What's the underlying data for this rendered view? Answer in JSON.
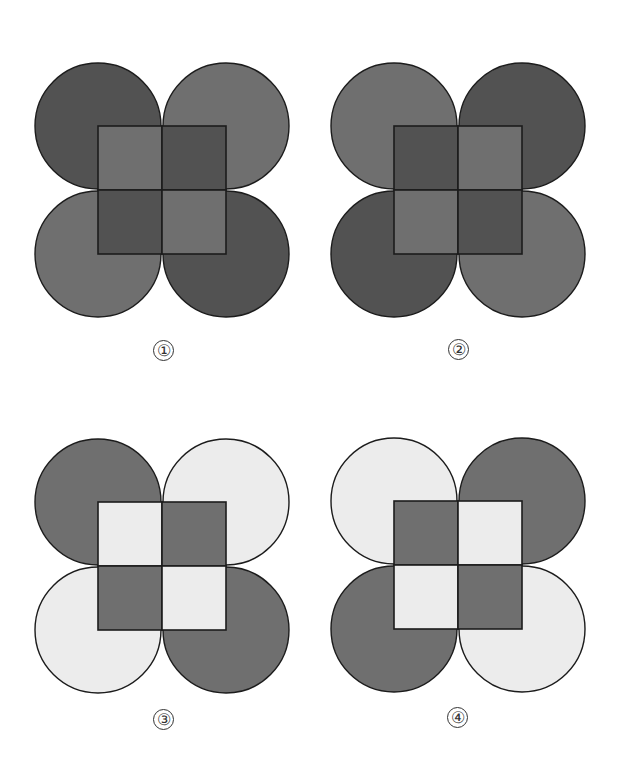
{
  "colors": {
    "dark": "#525252",
    "medium": "#6f6f6f",
    "light": "#ececec",
    "stroke": "#1c1c1c",
    "background": "#ffffff"
  },
  "geometry": {
    "radius": 63,
    "square_half_side": 64
  },
  "figures": [
    {
      "label": "①",
      "center": [
        162,
        190
      ],
      "label_pos": [
        153,
        340
      ],
      "circles": {
        "top_left": "dark",
        "top_right": "medium",
        "bottom_left": "medium",
        "bottom_right": "dark"
      },
      "quadrants": {
        "top_left": "medium",
        "top_right": "dark",
        "bottom_left": "dark",
        "bottom_right": "medium"
      }
    },
    {
      "label": "②",
      "center": [
        458,
        190
      ],
      "label_pos": [
        448,
        339
      ],
      "circles": {
        "top_left": "medium",
        "top_right": "dark",
        "bottom_left": "dark",
        "bottom_right": "medium"
      },
      "quadrants": {
        "top_left": "dark",
        "top_right": "medium",
        "bottom_left": "medium",
        "bottom_right": "dark"
      }
    },
    {
      "label": "③",
      "center": [
        162,
        566
      ],
      "label_pos": [
        153,
        709
      ],
      "circles": {
        "top_left": "medium",
        "top_right": "light",
        "bottom_left": "light",
        "bottom_right": "medium"
      },
      "quadrants": {
        "top_left": "light",
        "top_right": "medium",
        "bottom_left": "medium",
        "bottom_right": "light"
      }
    },
    {
      "label": "④",
      "center": [
        458,
        565
      ],
      "label_pos": [
        447,
        707
      ],
      "circles": {
        "top_left": "light",
        "top_right": "medium",
        "bottom_left": "medium",
        "bottom_right": "light"
      },
      "quadrants": {
        "top_left": "medium",
        "top_right": "light",
        "bottom_left": "light",
        "bottom_right": "medium"
      }
    }
  ]
}
